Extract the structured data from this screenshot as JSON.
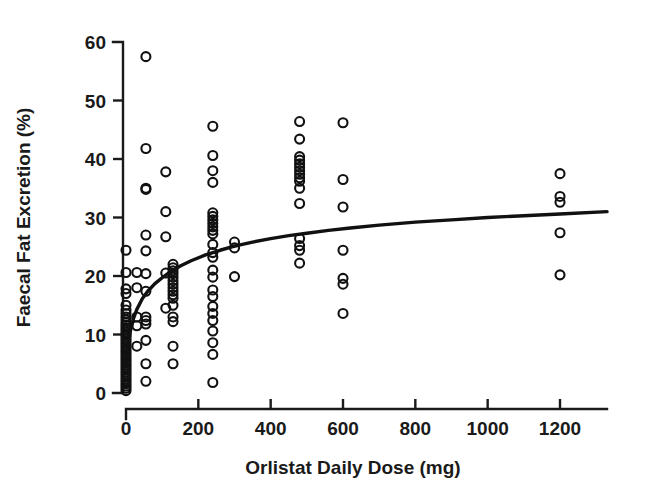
{
  "figure": {
    "background_color": "#ffffff",
    "ink_color": "#111111"
  },
  "chart_data": {
    "type": "scatter",
    "title": "",
    "subtitle": "",
    "xlabel": "Orlistat Daily Dose (mg)",
    "ylabel": "Faecal Fat Excretion (%)",
    "xlim": [
      -40,
      1340
    ],
    "ylim": [
      0,
      60
    ],
    "xticks": [
      0,
      200,
      400,
      600,
      800,
      1000,
      1200
    ],
    "xticklabels": [
      "0",
      "200",
      "400",
      "600",
      "800",
      "1000",
      "1200"
    ],
    "yticks": [
      0,
      10,
      20,
      30,
      40,
      50,
      60
    ],
    "yticklabels": [
      "0",
      "10",
      "20",
      "30",
      "40",
      "50",
      "60"
    ],
    "grid": false,
    "legend": false,
    "legend_position": "none",
    "marker": "open-circle",
    "marker_size_px": 9,
    "series": [
      {
        "name": "Faecal fat excretion by orlistat dose",
        "points": [
          [
            0,
            0.4
          ],
          [
            0,
            0.8
          ],
          [
            0,
            1.2
          ],
          [
            0,
            1.6
          ],
          [
            0,
            2.0
          ],
          [
            0,
            2.4
          ],
          [
            0,
            2.8
          ],
          [
            0,
            3.2
          ],
          [
            0,
            3.6
          ],
          [
            0,
            4.0
          ],
          [
            0,
            4.4
          ],
          [
            0,
            4.8
          ],
          [
            0,
            5.2
          ],
          [
            0,
            5.6
          ],
          [
            0,
            6.0
          ],
          [
            0,
            6.4
          ],
          [
            0,
            6.8
          ],
          [
            0,
            7.2
          ],
          [
            0,
            7.6
          ],
          [
            0,
            8.0
          ],
          [
            0,
            8.4
          ],
          [
            0,
            8.8
          ],
          [
            0,
            9.2
          ],
          [
            0,
            9.6
          ],
          [
            0,
            10.0
          ],
          [
            0,
            10.4
          ],
          [
            0,
            10.8
          ],
          [
            0,
            11.2
          ],
          [
            0,
            11.6
          ],
          [
            0,
            12.0
          ],
          [
            0,
            12.5
          ],
          [
            0,
            13.0
          ],
          [
            0,
            13.6
          ],
          [
            0,
            14.2
          ],
          [
            0,
            15.0
          ],
          [
            0,
            17.0
          ],
          [
            0,
            17.8
          ],
          [
            0,
            20.6
          ],
          [
            0,
            24.4
          ],
          [
            30,
            18.0
          ],
          [
            30,
            20.6
          ],
          [
            30,
            13.0
          ],
          [
            30,
            11.5
          ],
          [
            30,
            8.0
          ],
          [
            55,
            57.5
          ],
          [
            55,
            41.8
          ],
          [
            55,
            35.0
          ],
          [
            55,
            34.8
          ],
          [
            55,
            27.0
          ],
          [
            55,
            24.3
          ],
          [
            55,
            20.4
          ],
          [
            55,
            17.4
          ],
          [
            55,
            13.0
          ],
          [
            55,
            12.4
          ],
          [
            55,
            11.8
          ],
          [
            55,
            9.0
          ],
          [
            55,
            5.0
          ],
          [
            55,
            2.0
          ],
          [
            110,
            37.8
          ],
          [
            110,
            31.0
          ],
          [
            110,
            26.7
          ],
          [
            110,
            20.5
          ],
          [
            110,
            14.5
          ],
          [
            130,
            22.0
          ],
          [
            130,
            21.4
          ],
          [
            130,
            20.9
          ],
          [
            130,
            20.4
          ],
          [
            130,
            19.8
          ],
          [
            130,
            19.2
          ],
          [
            130,
            18.6
          ],
          [
            130,
            18.0
          ],
          [
            130,
            17.4
          ],
          [
            130,
            16.8
          ],
          [
            130,
            16.2
          ],
          [
            130,
            15.0
          ],
          [
            130,
            13.0
          ],
          [
            130,
            12.2
          ],
          [
            130,
            8.0
          ],
          [
            130,
            5.0
          ],
          [
            240,
            45.6
          ],
          [
            240,
            40.6
          ],
          [
            240,
            38.0
          ],
          [
            240,
            36.0
          ],
          [
            240,
            30.8
          ],
          [
            240,
            30.2
          ],
          [
            240,
            29.6
          ],
          [
            240,
            29.0
          ],
          [
            240,
            28.4
          ],
          [
            240,
            27.8
          ],
          [
            240,
            27.2
          ],
          [
            240,
            25.4
          ],
          [
            240,
            24.0
          ],
          [
            240,
            23.2
          ],
          [
            240,
            21.0
          ],
          [
            240,
            19.8
          ],
          [
            240,
            17.6
          ],
          [
            240,
            16.5
          ],
          [
            240,
            14.8
          ],
          [
            240,
            13.6
          ],
          [
            240,
            12.4
          ],
          [
            240,
            10.6
          ],
          [
            240,
            8.6
          ],
          [
            240,
            6.6
          ],
          [
            240,
            1.8
          ],
          [
            300,
            25.8
          ],
          [
            300,
            24.8
          ],
          [
            300,
            19.9
          ],
          [
            480,
            46.4
          ],
          [
            480,
            43.4
          ],
          [
            480,
            40.4
          ],
          [
            480,
            39.8
          ],
          [
            480,
            39.2
          ],
          [
            480,
            38.6
          ],
          [
            480,
            38.0
          ],
          [
            480,
            37.4
          ],
          [
            480,
            36.8
          ],
          [
            480,
            36.2
          ],
          [
            480,
            35.0
          ],
          [
            480,
            32.4
          ],
          [
            480,
            26.4
          ],
          [
            480,
            25.2
          ],
          [
            480,
            24.4
          ],
          [
            480,
            22.2
          ],
          [
            600,
            46.2
          ],
          [
            600,
            36.5
          ],
          [
            600,
            31.8
          ],
          [
            600,
            24.4
          ],
          [
            600,
            19.6
          ],
          [
            600,
            18.6
          ],
          [
            600,
            13.6
          ],
          [
            1200,
            37.5
          ],
          [
            1200,
            33.6
          ],
          [
            1200,
            32.6
          ],
          [
            1200,
            27.4
          ],
          [
            1200,
            20.2
          ]
        ]
      }
    ],
    "fit_curve": {
      "name": "Dose-response fit (Emax)",
      "description": "Monotonic saturating dose-response curve",
      "points": [
        [
          0,
          5.0
        ],
        [
          6,
          8.2
        ],
        [
          12,
          10.6
        ],
        [
          20,
          12.6
        ],
        [
          30,
          14.3
        ],
        [
          45,
          16.1
        ],
        [
          60,
          17.4
        ],
        [
          80,
          18.7
        ],
        [
          100,
          19.7
        ],
        [
          120,
          20.6
        ],
        [
          150,
          21.7
        ],
        [
          180,
          22.6
        ],
        [
          220,
          23.6
        ],
        [
          260,
          24.4
        ],
        [
          300,
          25.1
        ],
        [
          350,
          25.8
        ],
        [
          400,
          26.4
        ],
        [
          450,
          26.9
        ],
        [
          500,
          27.3
        ],
        [
          560,
          27.8
        ],
        [
          620,
          28.2
        ],
        [
          700,
          28.7
        ],
        [
          800,
          29.2
        ],
        [
          900,
          29.6
        ],
        [
          1000,
          30.0
        ],
        [
          1100,
          30.3
        ],
        [
          1200,
          30.6
        ],
        [
          1330,
          31.0
        ]
      ]
    }
  }
}
